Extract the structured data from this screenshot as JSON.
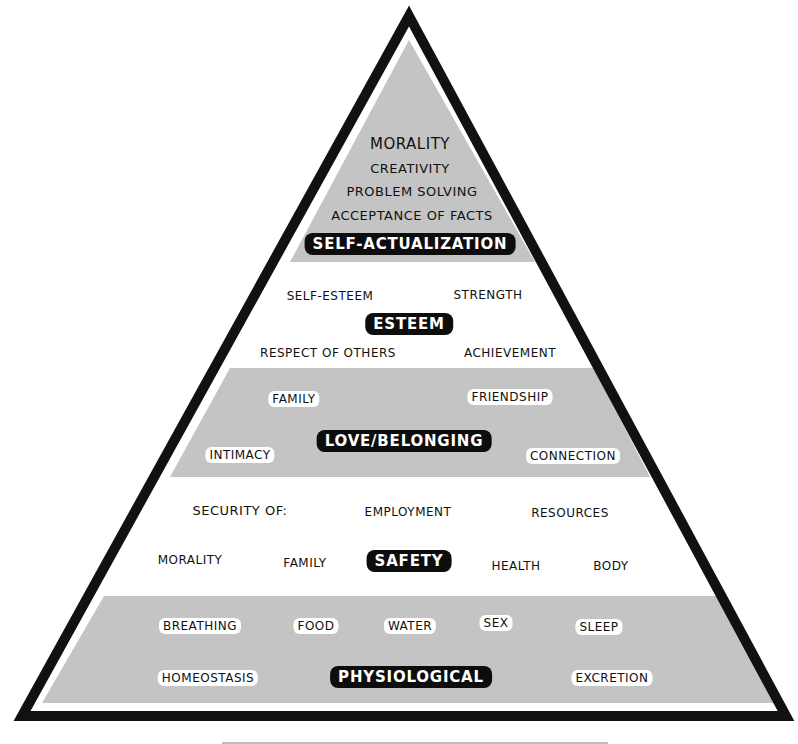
{
  "colors": {
    "outline": "#111111",
    "band_gray": "#c4c4c4",
    "background": "#ffffff",
    "title_bg": "#0d0d0d",
    "title_text": "#ffffff"
  },
  "levels": [
    {
      "title": "SELF-ACTUALIZATION",
      "shaded": true,
      "items": [
        "MORALITY",
        "CREATIVITY",
        "PROBLEM SOLVING",
        "ACCEPTANCE OF FACTS"
      ]
    },
    {
      "title": "ESTEEM",
      "shaded": false,
      "items": [
        "SELF-ESTEEM",
        "STRENGTH",
        "RESPECT OF OTHERS",
        "ACHIEVEMENT"
      ]
    },
    {
      "title": "LOVE/BELONGING",
      "shaded": true,
      "items": [
        "FAMILY",
        "FRIENDSHIP",
        "INTIMACY",
        "CONNECTION"
      ]
    },
    {
      "title": "SAFETY",
      "shaded": false,
      "prefix": "SECURITY OF:",
      "items": [
        "EMPLOYMENT",
        "RESOURCES",
        "MORALITY",
        "FAMILY",
        "HEALTH",
        "BODY"
      ]
    },
    {
      "title": "PHYSIOLOGICAL",
      "shaded": true,
      "items": [
        "BREATHING",
        "FOOD",
        "WATER",
        "SEX",
        "SLEEP",
        "HOMEOSTASIS",
        "EXCRETION"
      ]
    }
  ]
}
